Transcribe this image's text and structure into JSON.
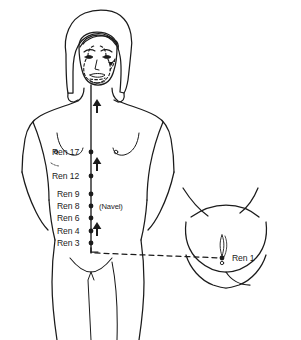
{
  "diagram": {
    "background_color": "#ffffff",
    "line_color": "#1b1b1b",
    "meridian": {
      "name": "Ren",
      "path": "midline-anterior",
      "direction": "ascending",
      "arrow_count": 3,
      "branch_style": "dashed"
    },
    "points": [
      {
        "id": "ren17",
        "label": "Ren 17",
        "x": 91,
        "y": 152,
        "label_x": 52,
        "label_y": 148,
        "side": "left"
      },
      {
        "id": "ren12",
        "label": "Ren 12",
        "x": 91,
        "y": 176,
        "label_x": 52,
        "label_y": 172,
        "side": "left"
      },
      {
        "id": "ren9",
        "label": "Ren 9",
        "x": 91,
        "y": 194,
        "label_x": 57,
        "label_y": 190,
        "side": "left"
      },
      {
        "id": "ren8",
        "label": "Ren 8",
        "x": 91,
        "y": 206,
        "label_x": 57,
        "label_y": 202,
        "side": "left"
      },
      {
        "id": "ren6",
        "label": "Ren 6",
        "x": 91,
        "y": 218,
        "label_x": 57,
        "label_y": 214,
        "side": "left"
      },
      {
        "id": "ren4",
        "label": "Ren 4",
        "x": 91,
        "y": 231,
        "label_x": 57,
        "label_y": 227,
        "side": "left"
      },
      {
        "id": "ren3",
        "label": "Ren 3",
        "x": 91,
        "y": 243,
        "label_x": 57,
        "label_y": 239,
        "side": "left"
      },
      {
        "id": "ren1",
        "label": "Ren 1",
        "x": 222,
        "y": 258,
        "label_x": 232,
        "label_y": 254,
        "side": "right"
      }
    ],
    "annotations": [
      {
        "id": "navel",
        "label": "(Navel)",
        "x": 99,
        "y": 203
      }
    ],
    "insets": [
      {
        "id": "perineum-inset",
        "label": "",
        "region": "perineum",
        "x": 160,
        "y": 185,
        "width": 141,
        "height": 115
      }
    ],
    "arrows": [
      {
        "id": "arrow-upper",
        "x": 97,
        "y": 108,
        "direction": "up"
      },
      {
        "id": "arrow-mid",
        "x": 97,
        "y": 166,
        "direction": "up"
      },
      {
        "id": "arrow-lower",
        "x": 97,
        "y": 231,
        "direction": "up"
      }
    ]
  }
}
